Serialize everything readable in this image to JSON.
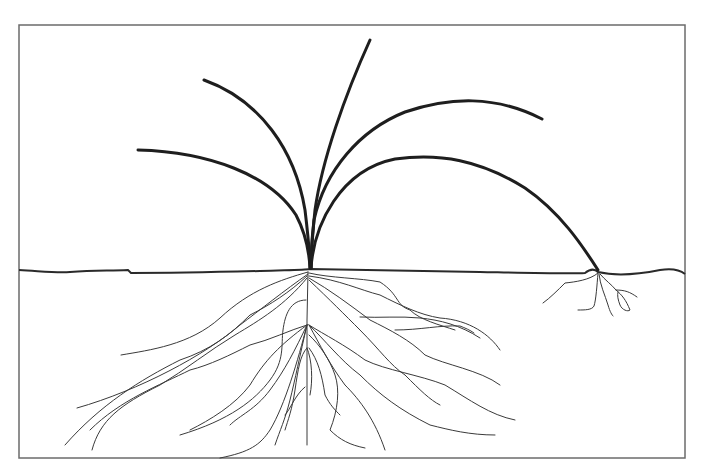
{
  "figure": {
    "colors": {
      "background": "#ffffff",
      "frame": "#6b6b6b",
      "ink": "#1e1e1e"
    },
    "parts": {
      "blades_count": 5,
      "runner_node": "rooted node on right side",
      "root_system": "fibrous"
    }
  }
}
